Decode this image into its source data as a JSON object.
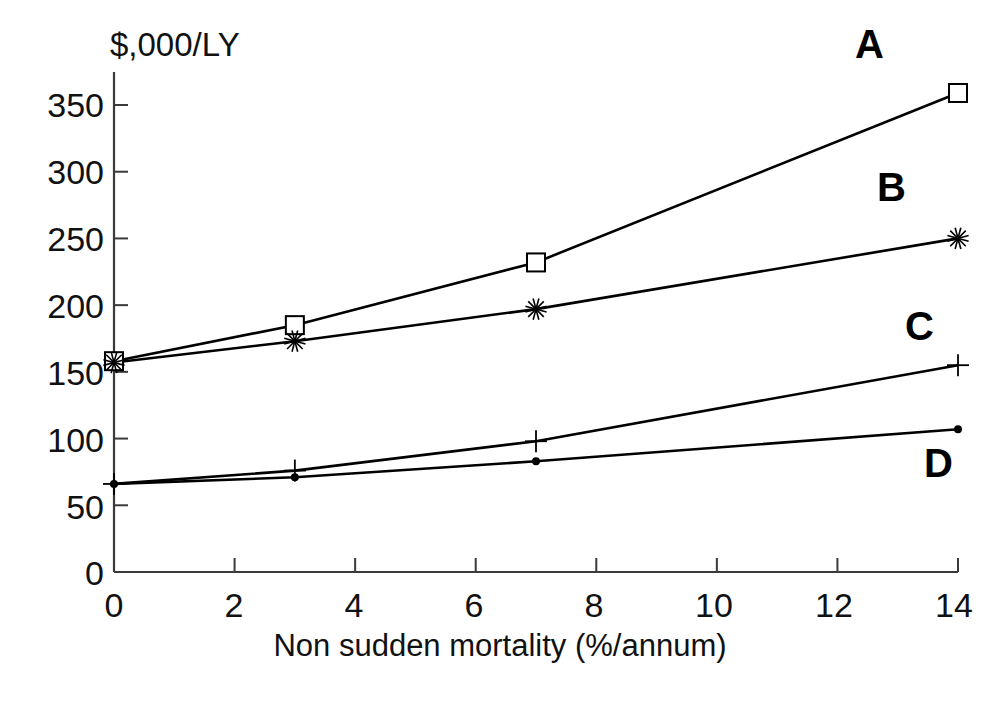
{
  "chart_data": {
    "type": "line",
    "title": "",
    "subtitle": "",
    "xlabel": "Non sudden mortality (%/annum)",
    "ylabel": "$,000/LY",
    "ylabel_position": "top-left-above-axis",
    "x": [
      0,
      3,
      7,
      14
    ],
    "xlim": [
      0,
      14
    ],
    "ylim": [
      0,
      375
    ],
    "xticks": [
      0,
      2,
      4,
      6,
      8,
      10,
      12,
      14
    ],
    "yticks": [
      0,
      50,
      100,
      150,
      200,
      250,
      300,
      350
    ],
    "grid": false,
    "legend": "inline-end-labels",
    "series": [
      {
        "name": "A",
        "label": "A",
        "marker": "open-square",
        "color": "#000000",
        "values": [
          158,
          185,
          232,
          359
        ]
      },
      {
        "name": "B",
        "label": "B",
        "marker": "asterisk",
        "color": "#000000",
        "values": [
          157,
          173,
          197,
          250
        ]
      },
      {
        "name": "C",
        "label": "C",
        "marker": "plus",
        "color": "#000000",
        "values": [
          66,
          76,
          98,
          155
        ]
      },
      {
        "name": "D",
        "label": "D",
        "marker": "filled-dot",
        "color": "#000000",
        "values": [
          66,
          71,
          83,
          107
        ]
      }
    ],
    "annotations": [
      {
        "text": "A",
        "series": "A",
        "x": 14,
        "y": 375
      },
      {
        "text": "B",
        "series": "B",
        "x": 14,
        "y": 285
      },
      {
        "text": "C",
        "series": "C",
        "x": 14,
        "y": 190
      },
      {
        "text": "D",
        "series": "D",
        "x": 14,
        "y": 82
      }
    ]
  },
  "axes": {
    "y_tick_labels": [
      "350",
      "300",
      "250",
      "200",
      "150",
      "100",
      "50",
      "0"
    ],
    "x_tick_labels": [
      "0",
      "2",
      "4",
      "6",
      "8",
      "10",
      "12",
      "14"
    ],
    "y_unit_label": "$,000/LY",
    "x_axis_title": "Non sudden mortality (%/annum)"
  },
  "series_labels": {
    "a": "A",
    "b": "B",
    "c": "C",
    "d": "D"
  },
  "colors": {
    "ink": "#000000",
    "axis": "#3a3a3a",
    "background": "#ffffff"
  }
}
